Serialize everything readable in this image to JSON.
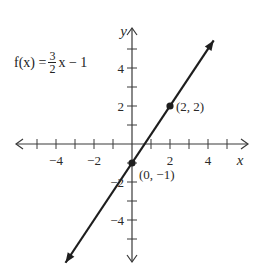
{
  "chart_data": {
    "type": "line",
    "title": "",
    "function_label": {
      "lhs": "f(x) = ",
      "frac_num": "3",
      "frac_den": "2",
      "rhs": "x − 1"
    },
    "equation": "f(x) = (3/2)x - 1",
    "slope": 1.5,
    "intercept": -1,
    "xlabel": "x",
    "ylabel": "y",
    "xlim": [
      -6,
      6
    ],
    "ylim": [
      -6,
      5.5
    ],
    "x_ticks": [
      -5,
      -4,
      -3,
      -2,
      -1,
      1,
      2,
      3,
      4,
      5
    ],
    "x_tick_labels": [
      {
        "value": -4,
        "label": "−4"
      },
      {
        "value": -2,
        "label": "−2"
      },
      {
        "value": 2,
        "label": "2"
      },
      {
        "value": 4,
        "label": "4"
      }
    ],
    "y_ticks": [
      -5,
      -4,
      -3,
      -2,
      -1,
      1,
      2,
      3,
      4,
      5
    ],
    "y_tick_labels": [
      {
        "value": 4,
        "label": "4"
      },
      {
        "value": 2,
        "label": "2"
      },
      {
        "value": -2,
        "label": "−2"
      },
      {
        "value": -4,
        "label": "−4"
      }
    ],
    "line_x_range": [
      -3.5,
      4.3
    ],
    "points": [
      {
        "x": 2,
        "y": 2,
        "label": "(2, 2)"
      },
      {
        "x": 0,
        "y": -1,
        "label": "(0, −1)"
      }
    ],
    "grid": false,
    "colors": {
      "line": "#1e1e1e",
      "axis": "#3a3a3a",
      "text": "#2a2a2a"
    }
  }
}
